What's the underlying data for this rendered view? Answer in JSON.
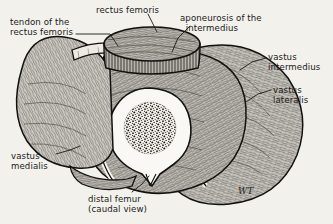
{
  "figure": {
    "background_color": "#f3f1ec",
    "ink_color": "#1a1a1a",
    "signature": "WT"
  },
  "labels": [
    {
      "id": "tendon-rectus-femoris",
      "text": "tendon of the\nrectus femoris",
      "align": "left",
      "x": 10,
      "y": 17
    },
    {
      "id": "rectus-femoris",
      "text": "rectus femoris",
      "align": "left",
      "x": 96,
      "y": 5
    },
    {
      "id": "aponeurosis-intermedius",
      "text": "aponeurosis of the\n  intermedius",
      "align": "left",
      "x": 180,
      "y": 13
    },
    {
      "id": "vastus-intermedius",
      "text": "vastus\nintermedius",
      "align": "left",
      "x": 268,
      "y": 52
    },
    {
      "id": "vastus-lateralis",
      "text": "vastus\nlateralis",
      "align": "left",
      "x": 273,
      "y": 85
    },
    {
      "id": "vastus-medialis",
      "text": "vastus\nmedialis",
      "align": "left",
      "x": 11,
      "y": 151
    },
    {
      "id": "distal-femur",
      "text": "distal femur\n(caudal view)",
      "align": "left",
      "x": 88,
      "y": 194
    }
  ],
  "structures": [
    {
      "id": "rectus-femoris",
      "name": "rectus femoris",
      "description": "oval muscle block elevated above the cut surface, top center"
    },
    {
      "id": "tendon-rectus-femoris",
      "name": "tendon of the rectus femoris",
      "description": "pale fascial band at upper left of the rectus femoris block"
    },
    {
      "id": "aponeurosis-intermedius",
      "name": "aponeurosis of the intermedius",
      "description": "thin pale sheet deep to the rectus femoris"
    },
    {
      "id": "vastus-medialis",
      "name": "vastus medialis",
      "description": "large muscle mass on the medial (left) side"
    },
    {
      "id": "vastus-intermedius",
      "name": "vastus intermedius",
      "description": "muscle layer directly surrounding the femur"
    },
    {
      "id": "vastus-lateralis",
      "name": "vastus lateralis",
      "description": "outer muscle layer on the lateral (right) side"
    },
    {
      "id": "distal-femur",
      "name": "distal femur",
      "description": "bone cross-section, cortical rim pale with stippled cancellous core"
    }
  ],
  "leaders": [
    {
      "id": "leader-tendon",
      "from": "tendon-rectus-femoris"
    },
    {
      "id": "leader-rectus",
      "from": "rectus-femoris"
    },
    {
      "id": "leader-aponeurosis",
      "from": "aponeurosis-intermedius"
    },
    {
      "id": "leader-intermedius",
      "from": "vastus-intermedius"
    },
    {
      "id": "leader-lateralis",
      "from": "vastus-lateralis"
    },
    {
      "id": "leader-medialis",
      "from": "vastus-medialis"
    },
    {
      "id": "leader-femur",
      "from": "distal-femur"
    }
  ]
}
